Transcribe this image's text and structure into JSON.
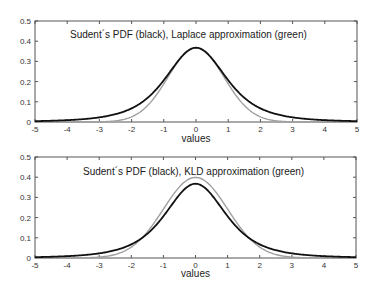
{
  "chart_data": [
    {
      "type": "line",
      "title": "Sudent´s PDF (black), Laplace approximation (green)",
      "xlabel": "values",
      "ylabel": "",
      "xlim": [
        -5,
        5
      ],
      "ylim": [
        0,
        0.5
      ],
      "xticks": [
        -5,
        -4,
        -3,
        -2,
        -1,
        0,
        1,
        2,
        3,
        4,
        5
      ],
      "yticks": [
        0,
        0.1,
        0.2,
        0.3,
        0.4,
        0.5
      ],
      "xtick_labels": [
        "-5",
        "-4",
        "-3",
        "-2",
        "-1",
        "0",
        "1",
        "2",
        "3",
        "4",
        "5"
      ],
      "ytick_labels": [
        "0",
        "0.1",
        "0.2",
        "0.3",
        "0.4",
        "0.5"
      ],
      "grid": false,
      "legend": "none",
      "series": [
        {
          "name": "Student's PDF",
          "color": "#111111",
          "kind": "student_t",
          "dof": 3,
          "x": [
            -5,
            -4,
            -3,
            -2,
            -1.5,
            -1,
            -0.5,
            0,
            0.5,
            1,
            1.5,
            2,
            3,
            4,
            5
          ],
          "values": [
            0.004,
            0.009,
            0.023,
            0.068,
            0.117,
            0.207,
            0.313,
            0.368,
            0.313,
            0.207,
            0.117,
            0.068,
            0.023,
            0.009,
            0.004
          ]
        },
        {
          "name": "Laplace approximation",
          "color": "#a0a0a0",
          "kind": "gaussian",
          "sigma": 0.866,
          "peak": 0.368,
          "x": [
            -3,
            -2.5,
            -2,
            -1.5,
            -1,
            -0.5,
            0,
            0.5,
            1,
            1.5,
            2,
            2.5,
            3
          ],
          "values": [
            0.001,
            0.006,
            0.026,
            0.082,
            0.189,
            0.311,
            0.368,
            0.311,
            0.189,
            0.082,
            0.026,
            0.006,
            0.001
          ]
        }
      ]
    },
    {
      "type": "line",
      "title": "Sudent´s PDF (black), KLD approximation (green)",
      "xlabel": "values",
      "ylabel": "",
      "xlim": [
        -5,
        5
      ],
      "ylim": [
        0,
        0.5
      ],
      "xticks": [
        -5,
        -4,
        -3,
        -2,
        -1,
        0,
        1,
        2,
        3,
        4,
        5
      ],
      "yticks": [
        0,
        0.1,
        0.2,
        0.3,
        0.4,
        0.5
      ],
      "xtick_labels": [
        "-5",
        "-4",
        "-3",
        "-2",
        "-1",
        "0",
        "1",
        "2",
        "3",
        "4",
        "5"
      ],
      "ytick_labels": [
        "0",
        "0.1",
        "0.2",
        "0.3",
        "0.4",
        "0.5"
      ],
      "grid": false,
      "legend": "none",
      "series": [
        {
          "name": "Student's PDF",
          "color": "#111111",
          "kind": "student_t",
          "dof": 3,
          "x": [
            -5,
            -4,
            -3,
            -2,
            -1.5,
            -1,
            -0.5,
            0,
            0.5,
            1,
            1.5,
            2,
            3,
            4,
            5
          ],
          "values": [
            0.004,
            0.009,
            0.023,
            0.068,
            0.117,
            0.207,
            0.313,
            0.368,
            0.313,
            0.207,
            0.117,
            0.068,
            0.023,
            0.009,
            0.004
          ]
        },
        {
          "name": "KLD approximation",
          "color": "#a0a0a0",
          "kind": "gaussian",
          "sigma": 1.0,
          "peak": 0.399,
          "x": [
            -3,
            -2.5,
            -2,
            -1.5,
            -1,
            -0.5,
            0,
            0.5,
            1,
            1.5,
            2,
            2.5,
            3
          ],
          "values": [
            0.004,
            0.018,
            0.054,
            0.13,
            0.242,
            0.352,
            0.399,
            0.352,
            0.242,
            0.13,
            0.054,
            0.018,
            0.004
          ]
        }
      ]
    }
  ]
}
